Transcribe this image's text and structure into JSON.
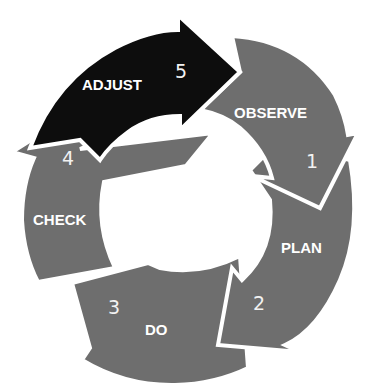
{
  "diagram": {
    "type": "cycle",
    "colors": {
      "segment_default": "#6e6e6e",
      "segment_active": "#0d0d0d",
      "text": "#ffffff",
      "background": "#ffffff"
    },
    "steps": [
      {
        "number": "1",
        "label": "OBSERVE",
        "active": false
      },
      {
        "number": "2",
        "label": "PLAN",
        "active": false
      },
      {
        "number": "3",
        "label": "DO",
        "active": false
      },
      {
        "number": "4",
        "label": "CHECK",
        "active": false
      },
      {
        "number": "5",
        "label": "ADJUST",
        "active": true
      }
    ]
  }
}
